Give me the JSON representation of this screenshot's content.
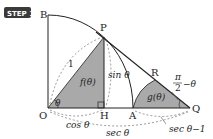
{
  "badge": "STEP 1",
  "points": {
    "B": "B",
    "P": "P",
    "R": "R",
    "O": "O",
    "H": "H",
    "A": "A",
    "Q": "Q"
  },
  "labels": {
    "radius": "1",
    "theta": "θ",
    "f": "f(θ)",
    "g": "g(θ)",
    "sin": "sin θ",
    "cos": "cos θ",
    "sec": "sec θ",
    "sec_minus_one": "sec θ−1",
    "angle_num": "π",
    "angle_den": "2",
    "angle_rest": "−θ"
  },
  "colors": {
    "badge": "#3a3a3a",
    "shade": "#a9a9a9",
    "line": "#222222",
    "dash": "#555555"
  }
}
